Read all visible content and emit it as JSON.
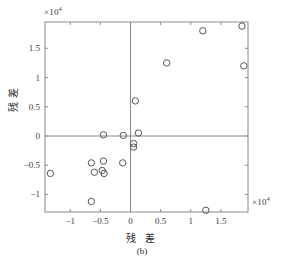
{
  "figure": {
    "caption": "(b)",
    "x_axis_title": "残 差",
    "y_axis_title": "残 差",
    "x_exponent_label": "×10",
    "x_exponent_power": "4",
    "y_exponent_label": "×10",
    "y_exponent_power": "4"
  },
  "chart_data": {
    "type": "scatter",
    "title": "",
    "subtitle": "(b)",
    "xlabel": "残 差",
    "ylabel": "残 差",
    "x_unit": "×10^4",
    "y_unit": "×10^4",
    "xlim": [
      -1.42,
      1.95
    ],
    "ylim": [
      -1.3,
      1.95
    ],
    "xticks": [
      -1,
      -0.5,
      0,
      0.5,
      1,
      1.5
    ],
    "xticklabels": [
      "-1",
      "-0.5",
      "0",
      "0.5",
      "1",
      "1.5"
    ],
    "yticks": [
      -1,
      -0.5,
      0,
      0.5,
      1,
      1.5
    ],
    "yticklabels": [
      "-1",
      "-0.5",
      "0",
      "0.5",
      "1",
      "1.5"
    ],
    "grid": false,
    "legend": null,
    "marker": "open-circle",
    "marker_size": 4,
    "marker_color": "#555555",
    "zero_lines": true,
    "points": [
      {
        "x": 1.85,
        "y": 1.88
      },
      {
        "x": 1.2,
        "y": 1.8
      },
      {
        "x": 0.6,
        "y": 1.25
      },
      {
        "x": 1.88,
        "y": 1.2
      },
      {
        "x": 0.08,
        "y": 0.6
      },
      {
        "x": 0.13,
        "y": 0.05
      },
      {
        "x": -0.45,
        "y": 0.02
      },
      {
        "x": -0.12,
        "y": 0.01
      },
      {
        "x": 0.05,
        "y": -0.13
      },
      {
        "x": 0.05,
        "y": -0.19
      },
      {
        "x": -0.65,
        "y": -0.46
      },
      {
        "x": -0.45,
        "y": -0.43
      },
      {
        "x": -0.6,
        "y": -0.62
      },
      {
        "x": -0.47,
        "y": -0.59
      },
      {
        "x": -0.44,
        "y": -0.64
      },
      {
        "x": -0.13,
        "y": -0.46
      },
      {
        "x": -1.33,
        "y": -0.64
      },
      {
        "x": -0.65,
        "y": -1.12
      },
      {
        "x": 1.25,
        "y": -1.27
      }
    ]
  },
  "style": {
    "frame_color": "#8a8a8a",
    "axis_line_color": "#8a8a8a",
    "tick_color": "#8a8a8a",
    "text_color": "#2b2b2b",
    "background": "#ffffff"
  }
}
